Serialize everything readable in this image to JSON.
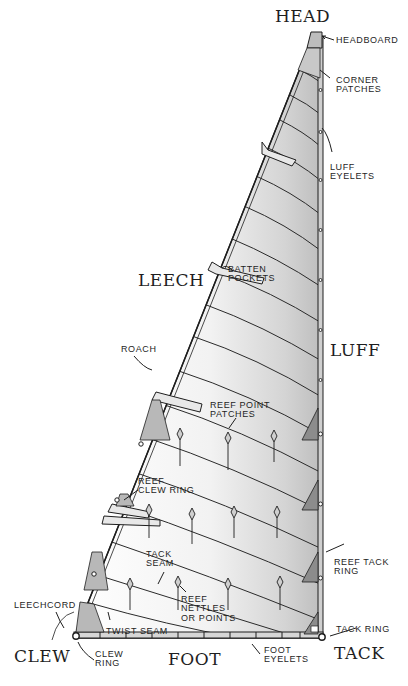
{
  "corners": {
    "head": "Head",
    "clew": "Clew",
    "tack": "Tack"
  },
  "edges": {
    "leech": "Leech",
    "luff": "Luff",
    "foot": "Foot"
  },
  "callouts": {
    "headboard": "Headboard",
    "corner_patches": "Corner\nPatches",
    "luff_eyelets": "Luff\nEyelets",
    "batten_pockets": "Batten\nPockets",
    "roach": "Roach",
    "reef_point_patches": "Reef Point\nPatches",
    "reef_clew_ring": "Reef\nClew Ring",
    "reef_tack_ring": "Reef Tack\nRing",
    "tack_seam": "Tack\nSeam",
    "reef_nettles": "Reef\nNettles\nor Points",
    "twist_seam": "Twist Seam",
    "leechcord": "Leechcord",
    "clew_ring": "Clew\nRing",
    "tack_ring": "Tack Ring",
    "foot_eyelets": "Foot\nEyelets"
  },
  "colors": {
    "ink": "#1e1e1e",
    "sail_light": "#f4f4f4",
    "sail_shade": "#d8d8d8",
    "patch": "#9a9a9a",
    "tape": "#e6e6e6"
  }
}
